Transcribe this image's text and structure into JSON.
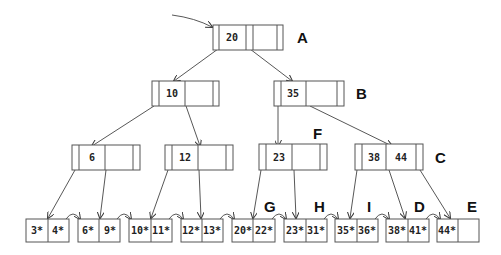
{
  "diagram": {
    "type": "B+ tree",
    "root_pointer": "arrow-into-root",
    "internal_nodes": [
      {
        "id": "A",
        "label": "A",
        "keys": [
          "20",
          ""
        ],
        "level": 0
      },
      {
        "id": "n10",
        "label": "",
        "keys": [
          "10",
          ""
        ],
        "level": 1
      },
      {
        "id": "B",
        "label": "B",
        "keys": [
          "35",
          ""
        ],
        "level": 1
      },
      {
        "id": "n6",
        "label": "",
        "keys": [
          "6",
          ""
        ],
        "level": 2
      },
      {
        "id": "n12",
        "label": "",
        "keys": [
          "12",
          ""
        ],
        "level": 2
      },
      {
        "id": "F",
        "label": "F",
        "keys": [
          "23",
          ""
        ],
        "level": 2
      },
      {
        "id": "C",
        "label": "C",
        "keys": [
          "38",
          "44"
        ],
        "level": 2
      }
    ],
    "leaves": [
      {
        "label": "",
        "entries": [
          "3*",
          "4*"
        ]
      },
      {
        "label": "",
        "entries": [
          "6*",
          "9*"
        ]
      },
      {
        "label": "",
        "entries": [
          "10*",
          "11*"
        ]
      },
      {
        "label": "",
        "entries": [
          "12*",
          "13*"
        ]
      },
      {
        "label": "",
        "entries": [
          "20*",
          "22*"
        ]
      },
      {
        "label": "G",
        "entries": [
          "23*",
          "31*"
        ]
      },
      {
        "label": "H",
        "entries": [
          "35*",
          "36*"
        ]
      },
      {
        "label": "I",
        "entries": [
          "38*",
          "41*"
        ]
      },
      {
        "label": "D",
        "entries": [
          "44*",
          ""
        ]
      }
    ],
    "extra_labels": {
      "E": "E"
    }
  }
}
